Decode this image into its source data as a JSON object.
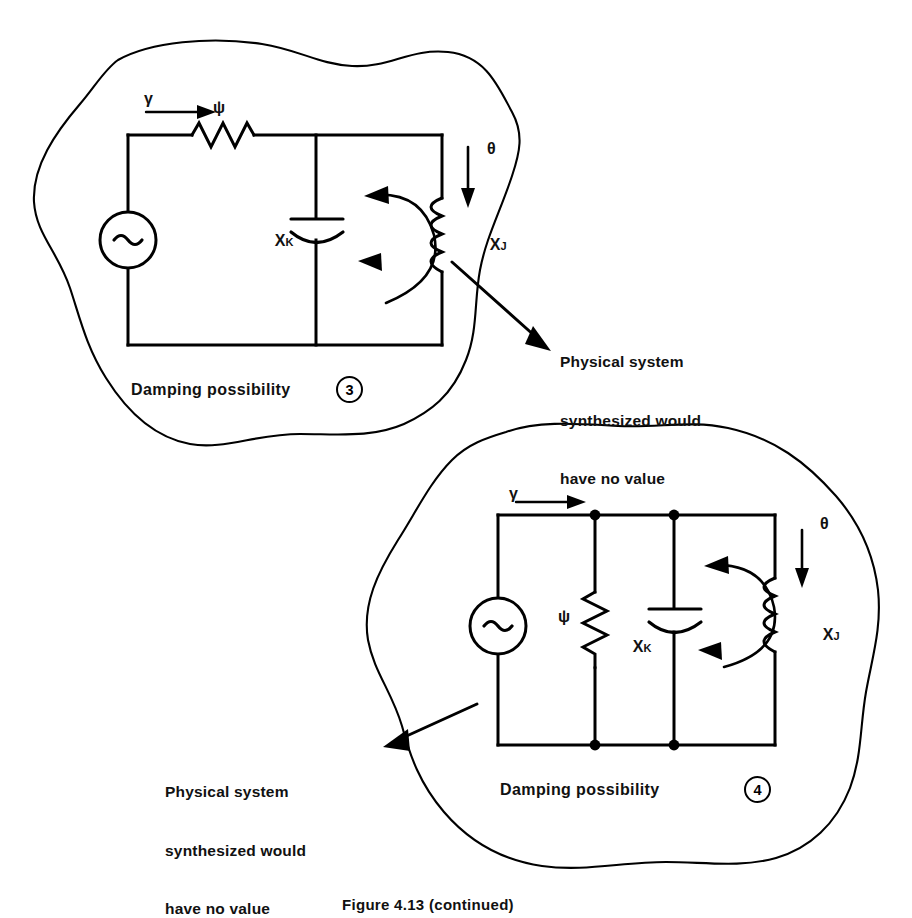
{
  "figure": {
    "caption": "Figure 4.13 (continued)",
    "annotation_note": "Physical system synthesized would have no value"
  },
  "circuits": [
    {
      "id": "damping-possibility-3",
      "caption_label": "Damping possibility",
      "caption_number": "3",
      "source_symbol": "~",
      "source_name": "ac-source",
      "elements": [
        {
          "name": "resistor",
          "symbol": "ψ",
          "orientation": "horizontal",
          "position": "top-rail"
        },
        {
          "name": "capacitor",
          "symbol": "X",
          "subscript": "K",
          "orientation": "vertical",
          "position": "middle-branch"
        },
        {
          "name": "inductor",
          "symbol": "X",
          "subscript": "J",
          "orientation": "vertical",
          "position": "right-branch"
        }
      ],
      "flow_labels": [
        {
          "symbol": "γ",
          "name": "gamma-input-arrow",
          "direction": "right"
        },
        {
          "symbol": "θ",
          "name": "theta-output-arrow",
          "direction": "down"
        }
      ],
      "loop_arrow": "counterclockwise-double"
    },
    {
      "id": "damping-possibility-4",
      "caption_label": "Damping possibility",
      "caption_number": "4",
      "source_symbol": "~",
      "source_name": "ac-source",
      "elements": [
        {
          "name": "resistor",
          "symbol": "ψ",
          "orientation": "vertical",
          "position": "second-branch"
        },
        {
          "name": "capacitor",
          "symbol": "X",
          "subscript": "K",
          "orientation": "vertical",
          "position": "third-branch"
        },
        {
          "name": "inductor",
          "symbol": "X",
          "subscript": "J",
          "orientation": "vertical",
          "position": "right-branch"
        }
      ],
      "flow_labels": [
        {
          "symbol": "γ",
          "name": "gamma-input-arrow",
          "direction": "right"
        },
        {
          "symbol": "θ",
          "name": "theta-output-arrow",
          "direction": "down"
        }
      ],
      "loop_arrow": "counterclockwise-double"
    }
  ],
  "annotations": [
    {
      "id": "note-upper",
      "lines": [
        "Physical system",
        "synthesized would",
        "have no value"
      ]
    },
    {
      "id": "note-lower",
      "lines": [
        "Physical system",
        "synthesized would",
        "have no value"
      ]
    }
  ],
  "colors": {
    "ink": "#000000",
    "paper": "#ffffff"
  }
}
